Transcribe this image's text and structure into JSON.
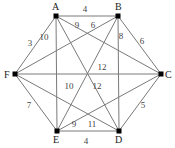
{
  "graph": {
    "nodes": [
      {
        "id": "A",
        "x": 56,
        "y": 16,
        "lx": 52,
        "ly": 10
      },
      {
        "id": "B",
        "x": 118,
        "y": 16,
        "lx": 115,
        "ly": 10
      },
      {
        "id": "C",
        "x": 161,
        "y": 74,
        "lx": 165,
        "ly": 78
      },
      {
        "id": "D",
        "x": 119,
        "y": 131,
        "lx": 115,
        "ly": 143
      },
      {
        "id": "E",
        "x": 57,
        "y": 131,
        "lx": 53,
        "ly": 143
      },
      {
        "id": "F",
        "x": 15,
        "y": 74,
        "lx": 4,
        "ly": 78
      }
    ],
    "edges": [
      {
        "from": "A",
        "to": "B",
        "weight": "4",
        "lx": 85,
        "ly": 12
      },
      {
        "from": "A",
        "to": "F",
        "weight": "3",
        "lx": 30,
        "ly": 46
      },
      {
        "from": "A",
        "to": "E",
        "weight": "10",
        "lx": 44,
        "ly": 40
      },
      {
        "from": "A",
        "to": "C",
        "weight": "9",
        "lx": 77,
        "ly": 28
      },
      {
        "from": "A",
        "to": "D",
        "weight": "12",
        "lx": 97,
        "ly": 89
      },
      {
        "from": "B",
        "to": "F",
        "weight": "6",
        "lx": 93,
        "ly": 28
      },
      {
        "from": "B",
        "to": "C",
        "weight": "6",
        "lx": 142,
        "ly": 44
      },
      {
        "from": "B",
        "to": "D",
        "weight": "8",
        "lx": 121,
        "ly": 39
      },
      {
        "from": "B",
        "to": "E",
        "weight": "10",
        "lx": 69,
        "ly": 89
      },
      {
        "from": "F",
        "to": "C",
        "weight": "12",
        "lx": 102,
        "ly": 70
      },
      {
        "from": "F",
        "to": "E",
        "weight": "7",
        "lx": 29,
        "ly": 108
      },
      {
        "from": "F",
        "to": "D",
        "weight": "11",
        "lx": 92,
        "ly": 127
      },
      {
        "from": "C",
        "to": "D",
        "weight": "5",
        "lx": 143,
        "ly": 108
      },
      {
        "from": "C",
        "to": "E",
        "weight": "9",
        "lx": 74,
        "ly": 127
      },
      {
        "from": "E",
        "to": "D",
        "weight": "4",
        "lx": 86,
        "ly": 144
      }
    ]
  }
}
